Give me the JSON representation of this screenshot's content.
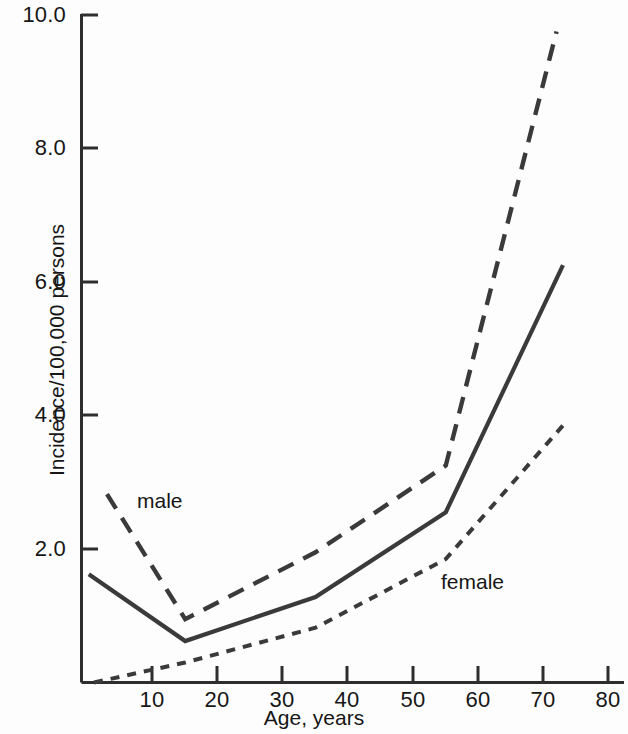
{
  "chart_data": {
    "type": "line",
    "title": "",
    "subtitle": "",
    "xlabel": "Age, years",
    "ylabel": "Incidence/100,000 persons",
    "xlim": [
      0,
      82
    ],
    "ylim": [
      0,
      10.4
    ],
    "xticks": [
      10,
      20,
      30,
      40,
      50,
      60,
      70,
      80
    ],
    "xtick_labels": [
      "10",
      "20",
      "30",
      "40",
      "50",
      "60",
      "70",
      "80"
    ],
    "yticks": [
      2.0,
      4.0,
      6.0,
      8.0,
      10.0
    ],
    "ytick_labels": [
      "2.0",
      "4.0",
      "6.0",
      "8.0",
      "10.0"
    ],
    "grid": false,
    "legend_position": "inline-annotations",
    "series": [
      {
        "name": "male",
        "label": "male",
        "style": "long-dashed",
        "color": "#3a3a3a",
        "x": [
          3,
          15,
          35,
          55,
          72
        ],
        "values": [
          2.82,
          0.95,
          1.95,
          3.25,
          9.75
        ]
      },
      {
        "name": "total",
        "label": "",
        "style": "solid",
        "color": "#3a3a3a",
        "x": [
          0.2,
          15,
          35,
          55,
          73
        ],
        "values": [
          1.62,
          0.62,
          1.28,
          2.55,
          6.25
        ]
      },
      {
        "name": "female",
        "label": "female",
        "style": "short-dashed",
        "color": "#3a3a3a",
        "x": [
          1,
          15,
          35,
          55,
          73
        ],
        "values": [
          0.0,
          0.3,
          0.82,
          1.85,
          3.85
        ]
      }
    ],
    "annotations": [
      {
        "text": "male",
        "x": 10,
        "y": 2.9
      },
      {
        "text": "female",
        "x": 55,
        "y": 1.7
      }
    ]
  },
  "axis": {
    "y_ticks": [
      {
        "label": "10.0"
      },
      {
        "label": "8.0"
      },
      {
        "label": "6.0"
      },
      {
        "label": "4.0"
      },
      {
        "label": "2.0"
      }
    ],
    "x_ticks": [
      {
        "label": "10"
      },
      {
        "label": "20"
      },
      {
        "label": "30"
      },
      {
        "label": "40"
      },
      {
        "label": "50"
      },
      {
        "label": "60"
      },
      {
        "label": "70"
      },
      {
        "label": "80"
      }
    ],
    "x_title": "Age, years",
    "y_title": "Incidence/100,000 persons"
  },
  "annotations": {
    "male": "male",
    "female": "female"
  },
  "colors": {
    "ink": "#3a3a3a",
    "text": "#161616",
    "background": "#fdfdfd"
  }
}
